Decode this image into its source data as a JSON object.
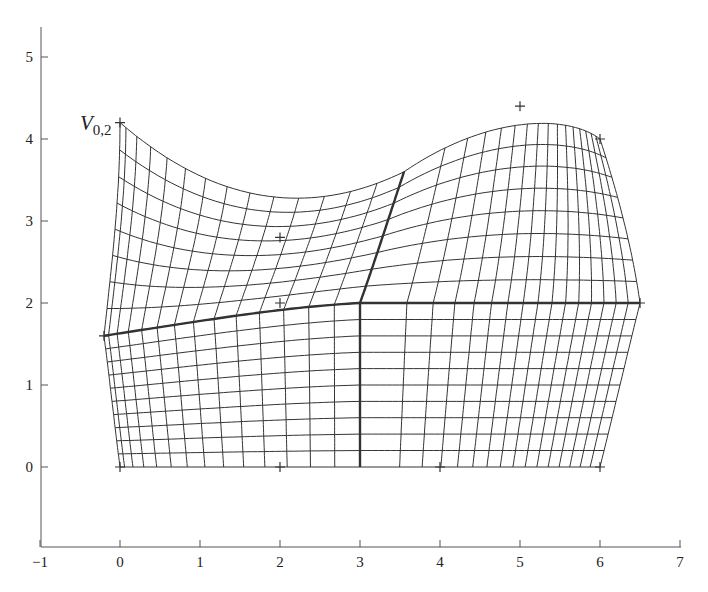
{
  "chart_data": {
    "type": "line",
    "title": "",
    "xlabel": "",
    "ylabel": "",
    "xlim": [
      -1,
      7
    ],
    "ylim": [
      -1,
      5.3
    ],
    "grid": false,
    "x_ticks": [
      "-1",
      "0",
      "1",
      "2",
      "3",
      "4",
      "5",
      "6",
      "7"
    ],
    "y_ticks": [
      "0",
      "1",
      "2",
      "3",
      "4",
      "5"
    ],
    "annotations": [
      {
        "text": "V",
        "subscript": "0,2",
        "x": 0,
        "y": 4.2
      }
    ],
    "control_points": [
      [
        0,
        0
      ],
      [
        2,
        0
      ],
      [
        4,
        0
      ],
      [
        6,
        0
      ],
      [
        -0.2,
        1.6
      ],
      [
        2,
        2
      ],
      [
        6.5,
        2
      ],
      [
        2,
        2.8
      ],
      [
        0,
        4.2
      ],
      [
        5,
        4.4
      ],
      [
        6,
        4
      ]
    ],
    "patches": [
      {
        "name": "bottom-left",
        "rows": 10,
        "cols": 14,
        "bottom": [
          [
            0,
            0
          ],
          [
            1,
            0
          ],
          [
            2,
            0
          ],
          [
            3,
            0
          ]
        ],
        "top": [
          [
            -0.2,
            1.6
          ],
          [
            0.8,
            1.75
          ],
          [
            2,
            1.95
          ],
          [
            3,
            2
          ]
        ],
        "left": [
          [
            0,
            0
          ],
          [
            -0.07,
            0.53
          ],
          [
            -0.13,
            1.07
          ],
          [
            -0.2,
            1.6
          ]
        ],
        "right": [
          [
            3,
            0
          ],
          [
            3,
            0.67
          ],
          [
            3,
            1.33
          ],
          [
            3,
            2
          ]
        ],
        "col_bias": 1.5
      },
      {
        "name": "bottom-right",
        "rows": 10,
        "cols": 16,
        "bottom": [
          [
            3,
            0
          ],
          [
            4,
            0
          ],
          [
            5,
            0
          ],
          [
            6,
            0
          ]
        ],
        "top": [
          [
            3,
            2
          ],
          [
            4.2,
            2
          ],
          [
            5.3,
            2
          ],
          [
            6.5,
            2
          ]
        ],
        "left": [
          [
            3,
            0
          ],
          [
            3,
            0.67
          ],
          [
            3,
            1.33
          ],
          [
            3,
            2
          ]
        ],
        "right": [
          [
            6,
            0
          ],
          [
            6.17,
            0.67
          ],
          [
            6.33,
            1.33
          ],
          [
            6.5,
            2
          ]
        ],
        "col_bias": 0.65
      },
      {
        "name": "top-left",
        "rows": 8,
        "cols": 14,
        "bottom": [
          [
            -0.2,
            1.6
          ],
          [
            0.8,
            1.75
          ],
          [
            2,
            1.95
          ],
          [
            3,
            2
          ]
        ],
        "top": [
          [
            0,
            4.2
          ],
          [
            1.3,
            3.1
          ],
          [
            2.5,
            3.1
          ],
          [
            3.55,
            3.6
          ]
        ],
        "left": [
          [
            -0.2,
            1.6
          ],
          [
            -0.1,
            2.5
          ],
          [
            0,
            3.3
          ],
          [
            0,
            4.2
          ]
        ],
        "right": [
          [
            3,
            2
          ],
          [
            3.2,
            2.55
          ],
          [
            3.38,
            3.1
          ],
          [
            3.55,
            3.6
          ]
        ],
        "col_bias": 1.5
      },
      {
        "name": "top-right",
        "rows": 8,
        "cols": 16,
        "bottom": [
          [
            3,
            2
          ],
          [
            4.2,
            2
          ],
          [
            5.3,
            2
          ],
          [
            6.5,
            2
          ]
        ],
        "top": [
          [
            3.55,
            3.6
          ],
          [
            4.6,
            4.3
          ],
          [
            5.6,
            4.3
          ],
          [
            6,
            4
          ]
        ],
        "left": [
          [
            3,
            2
          ],
          [
            3.2,
            2.55
          ],
          [
            3.38,
            3.1
          ],
          [
            3.55,
            3.6
          ]
        ],
        "right": [
          [
            6.5,
            2
          ],
          [
            6.4,
            2.7
          ],
          [
            6.2,
            3.4
          ],
          [
            6,
            4
          ]
        ],
        "col_bias": 0.65
      }
    ],
    "bold_lines": [
      [
        [
          -0.2,
          1.6
        ],
        [
          0.8,
          1.75
        ],
        [
          2,
          1.95
        ],
        [
          3,
          2
        ]
      ],
      [
        [
          3,
          2
        ],
        [
          4.2,
          2
        ],
        [
          5.3,
          2
        ],
        [
          6.5,
          2
        ]
      ],
      [
        [
          3,
          0
        ],
        [
          3,
          0.67
        ],
        [
          3,
          1.33
        ],
        [
          3,
          2
        ]
      ],
      [
        [
          3,
          2
        ],
        [
          3.2,
          2.55
        ],
        [
          3.38,
          3.1
        ],
        [
          3.55,
          3.6
        ]
      ]
    ],
    "mapping": {
      "x0_px": 120,
      "px_per_x": 80,
      "y0_px": 467,
      "px_per_y": 82
    },
    "colors": {
      "ink": "#333333",
      "axis": "#555555"
    }
  }
}
